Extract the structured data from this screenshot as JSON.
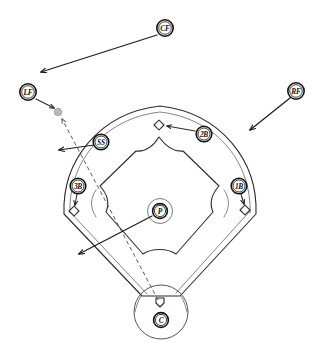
{
  "diagram": {
    "type": "baseball-field-play-diagram",
    "background_color": "#ffffff",
    "line_color": "#2b2b2b",
    "ball_color": "#cfcfcf",
    "positions": [
      {
        "id": "CF",
        "label": "CF",
        "name": "center-fielder",
        "x": 165,
        "y": 28
      },
      {
        "id": "LF",
        "label": "LF",
        "name": "left-fielder",
        "x": 28,
        "y": 92
      },
      {
        "id": "RF",
        "label": "RF",
        "name": "right-fielder",
        "x": 296,
        "y": 91
      },
      {
        "id": "SS",
        "label": "SS",
        "name": "shortstop",
        "x": 101,
        "y": 142
      },
      {
        "id": "2B",
        "label": "2B",
        "name": "second-baseman",
        "x": 204,
        "y": 134
      },
      {
        "id": "3B",
        "label": "3B",
        "name": "third-baseman",
        "x": 78,
        "y": 186
      },
      {
        "id": "1B",
        "label": "1B",
        "name": "first-baseman",
        "x": 239,
        "y": 186
      },
      {
        "id": "P",
        "label": "P",
        "name": "pitcher",
        "x": 160,
        "y": 211
      },
      {
        "id": "C",
        "label": "C",
        "name": "catcher",
        "x": 161,
        "y": 320
      }
    ],
    "bases": [
      {
        "name": "second-base",
        "x": 159,
        "y": 125
      },
      {
        "name": "third-base",
        "x": 74,
        "y": 211
      },
      {
        "name": "first-base",
        "x": 245,
        "y": 210
      },
      {
        "name": "home-plate",
        "x": 160,
        "y": 302
      }
    ],
    "ball_marker": {
      "name": "ball",
      "x": 58,
      "y": 112
    },
    "movement_arrows": [
      {
        "name": "cf-movement-arrow",
        "from": "CF",
        "x1": 157,
        "y1": 35,
        "x2": 39,
        "y2": 73,
        "style": "solid"
      },
      {
        "name": "lf-to-ball-arrow",
        "from": "LF",
        "x1": 36,
        "y1": 99,
        "x2": 55,
        "y2": 109,
        "style": "solid"
      },
      {
        "name": "rf-movement-arrow",
        "from": "RF",
        "x1": 290,
        "y1": 98,
        "x2": 248,
        "y2": 131,
        "style": "solid"
      },
      {
        "name": "ss-movement-arrow",
        "from": "SS",
        "x1": 94,
        "y1": 145,
        "x2": 57,
        "y2": 150,
        "style": "solid"
      },
      {
        "name": "2b-to-second-base-arrow",
        "from": "2B",
        "x1": 195,
        "y1": 131,
        "x2": 166,
        "y2": 125,
        "style": "solid"
      },
      {
        "name": "3b-to-third-base-arrow",
        "from": "3B",
        "x1": 77,
        "y1": 194,
        "x2": 75,
        "y2": 206,
        "style": "solid"
      },
      {
        "name": "1b-to-first-base-arrow",
        "from": "1B",
        "x1": 241,
        "y1": 194,
        "x2": 244,
        "y2": 205,
        "style": "solid"
      },
      {
        "name": "pitcher-movement-arrow",
        "from": "P",
        "x1": 152,
        "y1": 216,
        "x2": 77,
        "y2": 255,
        "style": "solid"
      }
    ],
    "ball_flight_path": {
      "name": "ball-flight-dashed-path",
      "style": "dashed",
      "from": "home-plate",
      "to": "ball",
      "x1": 158,
      "y1": 300,
      "x2": 60,
      "y2": 118
    }
  }
}
